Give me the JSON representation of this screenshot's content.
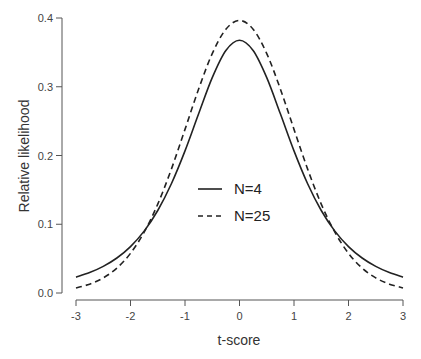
{
  "chart_data": {
    "type": "line",
    "title": "",
    "xlabel": "t-score",
    "ylabel": "Relative likelihood",
    "xlim": [
      -3,
      3
    ],
    "ylim": [
      0,
      0.4
    ],
    "xticks": [
      "-3",
      "-2",
      "-1",
      "0",
      "1",
      "2",
      "3"
    ],
    "yticks": [
      "0.0",
      "0.1",
      "0.2",
      "0.3",
      "0.4"
    ],
    "grid": false,
    "legend_position": "center",
    "x": [
      -3,
      -2.75,
      -2.5,
      -2.25,
      -2,
      -1.75,
      -1.5,
      -1.25,
      -1,
      -0.75,
      -0.5,
      -0.25,
      0,
      0.25,
      0.5,
      0.75,
      1,
      1.25,
      1.5,
      1.75,
      2,
      2.25,
      2.5,
      2.75,
      3
    ],
    "series": [
      {
        "name": "N=4",
        "style": "solid",
        "values": [
          0.023,
          0.0297,
          0.0387,
          0.0509,
          0.0675,
          0.09,
          0.12,
          0.1589,
          0.2067,
          0.2606,
          0.3132,
          0.3527,
          0.3676,
          0.3527,
          0.3132,
          0.2606,
          0.2067,
          0.1589,
          0.12,
          0.09,
          0.0675,
          0.0509,
          0.0387,
          0.0297,
          0.023
        ]
      },
      {
        "name": "N=25",
        "style": "dashed",
        "values": [
          0.0074,
          0.0129,
          0.022,
          0.0362,
          0.0577,
          0.0884,
          0.1293,
          0.1802,
          0.238,
          0.2967,
          0.3482,
          0.3837,
          0.3964,
          0.3837,
          0.3482,
          0.2967,
          0.238,
          0.1802,
          0.1293,
          0.0884,
          0.0577,
          0.0362,
          0.022,
          0.0129,
          0.0074
        ]
      }
    ]
  },
  "colors": {
    "line": "#222222",
    "axis": "#555555",
    "background": "#ffffff"
  }
}
